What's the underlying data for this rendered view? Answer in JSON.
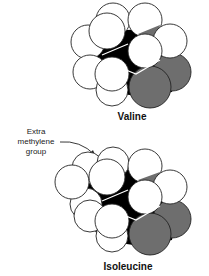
{
  "figure": {
    "type": "space-filling molecular models",
    "molecules": [
      {
        "id": "valine",
        "label": "Valine"
      },
      {
        "id": "isoleucine",
        "label": "Isoleucine"
      }
    ],
    "annotation": {
      "lines": [
        "Extra",
        "methylene",
        "group"
      ],
      "points_to": "isoleucine"
    },
    "colors": {
      "background": "#ffffff",
      "carbon_hydrogen_atoms": "#ffffff",
      "shadow_core": "#000000",
      "oxygen_atoms": "#6e6e6e",
      "outline": "#222222"
    }
  }
}
